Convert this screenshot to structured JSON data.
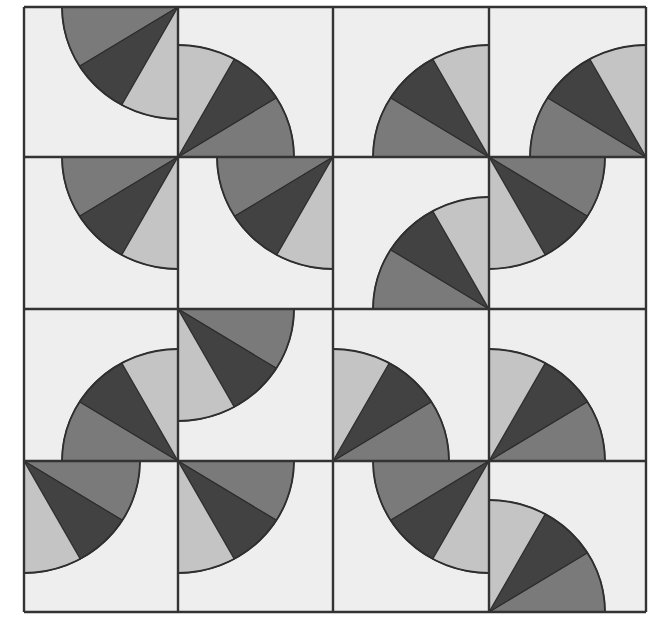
{
  "figure": {
    "type": "quilt-pattern",
    "grid": {
      "rows": 4,
      "cols": 4,
      "left": 24,
      "top": 7,
      "right": 646,
      "bottom": 612,
      "col_lines": [
        24,
        178,
        333,
        489,
        646
      ],
      "row_lines": [
        7,
        157,
        309,
        461,
        612
      ]
    },
    "colors": {
      "background": "#eeeeee",
      "page": "#ffffff",
      "light": "#c4c4c4",
      "dark": "#424242",
      "medium": "#7a7a7a",
      "line": "#333333"
    },
    "pie": {
      "rx": 116,
      "ry": 112,
      "wedge_angles_deg": [
        0,
        32,
        61,
        90
      ],
      "wedge_order_from_horizontal": [
        "medium",
        "dark",
        "light"
      ]
    },
    "tiles": [
      [
        "TR",
        "BL",
        "BR",
        "BR"
      ],
      [
        "TR",
        "TR",
        "BR",
        "TL"
      ],
      [
        "BR",
        "TL",
        "BL",
        "BL"
      ],
      [
        "TL",
        "TL",
        "TR",
        "BL"
      ]
    ]
  }
}
